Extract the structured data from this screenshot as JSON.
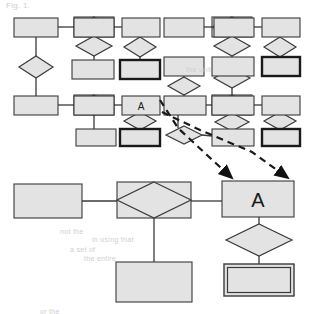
{
  "figure": {
    "kind": "er-diagram",
    "background_color": "#ffffff",
    "shape_fill": "#e3e3e3",
    "shape_stroke": "#3a3a3a",
    "bold_stroke": "#1a1a1a",
    "connector_color": "#3a3a3a",
    "callout_color": "#1a1a1a"
  },
  "overview": {
    "name": "overview-schema",
    "caption": "",
    "entities": [
      {
        "id": "ov-e1",
        "label": "",
        "x": 14,
        "y": 18,
        "w": 44,
        "h": 19,
        "style": "strong"
      },
      {
        "id": "ov-e2",
        "label": "",
        "x": 74,
        "y": 18,
        "w": 40,
        "h": 19,
        "style": "strong"
      },
      {
        "id": "ov-e3",
        "label": "",
        "x": 122,
        "y": 18,
        "w": 38,
        "h": 19,
        "style": "strong"
      },
      {
        "id": "ov-e4",
        "label": "",
        "x": 164,
        "y": 18,
        "w": 40,
        "h": 19,
        "style": "strong"
      },
      {
        "id": "ov-e5",
        "label": "",
        "x": 214,
        "y": 18,
        "w": 40,
        "h": 19,
        "style": "strong"
      },
      {
        "id": "ov-e6",
        "label": "",
        "x": 262,
        "y": 18,
        "w": 38,
        "h": 19,
        "style": "strong"
      },
      {
        "id": "ov-e7",
        "label": "",
        "x": 72,
        "y": 60,
        "w": 42,
        "h": 19,
        "style": "strong"
      },
      {
        "id": "ov-e8",
        "label": "",
        "x": 120,
        "y": 60,
        "w": 40,
        "h": 19,
        "style": "bold"
      },
      {
        "id": "ov-e9",
        "label": "",
        "x": 164,
        "y": 57,
        "w": 40,
        "h": 19,
        "style": "strong"
      },
      {
        "id": "ov-e10",
        "label": "",
        "x": 212,
        "y": 57,
        "w": 42,
        "h": 19,
        "style": "strong"
      },
      {
        "id": "ov-e11",
        "label": "",
        "x": 262,
        "y": 57,
        "w": 38,
        "h": 19,
        "style": "bold"
      },
      {
        "id": "ov-e12",
        "label": "",
        "x": 14,
        "y": 96,
        "w": 44,
        "h": 19,
        "style": "strong"
      },
      {
        "id": "ov-e13",
        "label": "",
        "x": 74,
        "y": 96,
        "w": 40,
        "h": 19,
        "style": "strong"
      },
      {
        "id": "ov-e14",
        "label": "A",
        "x": 122,
        "y": 96,
        "w": 38,
        "h": 19,
        "style": "strong"
      },
      {
        "id": "ov-e15",
        "label": "",
        "x": 164,
        "y": 96,
        "w": 42,
        "h": 19,
        "style": "strong"
      },
      {
        "id": "ov-e16",
        "label": "",
        "x": 212,
        "y": 96,
        "w": 42,
        "h": 19,
        "style": "strong"
      },
      {
        "id": "ov-e17",
        "label": "",
        "x": 262,
        "y": 96,
        "w": 38,
        "h": 19,
        "style": "strong"
      },
      {
        "id": "ov-e18",
        "label": "",
        "x": 76,
        "y": 129,
        "w": 40,
        "h": 17,
        "style": "strong"
      },
      {
        "id": "ov-e19",
        "label": "",
        "x": 120,
        "y": 129,
        "w": 40,
        "h": 17,
        "style": "bold"
      },
      {
        "id": "ov-e20",
        "label": "",
        "x": 212,
        "y": 129,
        "w": 42,
        "h": 17,
        "style": "strong"
      },
      {
        "id": "ov-e21",
        "label": "",
        "x": 262,
        "y": 129,
        "w": 38,
        "h": 17,
        "style": "bold"
      }
    ],
    "relationships": [
      {
        "id": "ov-r1",
        "label": "",
        "cx": 36,
        "cy": 67,
        "rx": 17,
        "ry": 11,
        "style": "plain"
      },
      {
        "id": "ov-r2",
        "label": "",
        "cx": 94,
        "cy": 27,
        "rx": 20,
        "ry": 10,
        "style": "boxed"
      },
      {
        "id": "ov-r3",
        "label": "",
        "cx": 94,
        "cy": 46,
        "rx": 18,
        "ry": 10,
        "style": "plain"
      },
      {
        "id": "ov-r4",
        "label": "",
        "cx": 140,
        "cy": 47,
        "rx": 16,
        "ry": 10,
        "style": "plain"
      },
      {
        "id": "ov-r5",
        "label": "",
        "cx": 232,
        "cy": 27,
        "rx": 20,
        "ry": 10,
        "style": "boxed"
      },
      {
        "id": "ov-r6",
        "label": "",
        "cx": 232,
        "cy": 46,
        "rx": 18,
        "ry": 10,
        "style": "plain"
      },
      {
        "id": "ov-r7",
        "label": "",
        "cx": 280,
        "cy": 47,
        "rx": 16,
        "ry": 10,
        "style": "plain"
      },
      {
        "id": "ov-r8",
        "label": "",
        "cx": 184,
        "cy": 86,
        "rx": 16,
        "ry": 9,
        "style": "plain"
      },
      {
        "id": "ov-r9",
        "label": "",
        "cx": 232,
        "cy": 78,
        "rx": 18,
        "ry": 10,
        "style": "plain"
      },
      {
        "id": "ov-r10",
        "label": "",
        "cx": 94,
        "cy": 105,
        "rx": 20,
        "ry": 10,
        "style": "boxed"
      },
      {
        "id": "ov-r11",
        "label": "",
        "cx": 232,
        "cy": 105,
        "rx": 20,
        "ry": 10,
        "style": "boxed"
      },
      {
        "id": "ov-r12",
        "label": "",
        "cx": 140,
        "cy": 121,
        "rx": 16,
        "ry": 9,
        "style": "plain"
      },
      {
        "id": "ov-r13",
        "label": "",
        "cx": 232,
        "cy": 122,
        "rx": 17,
        "ry": 9,
        "style": "plain"
      },
      {
        "id": "ov-r14",
        "label": "",
        "cx": 280,
        "cy": 121,
        "rx": 16,
        "ry": 9,
        "style": "plain"
      },
      {
        "id": "ov-r15",
        "label": "",
        "cx": 184,
        "cy": 135,
        "rx": 18,
        "ry": 9,
        "style": "plain"
      }
    ],
    "connectors": [
      {
        "from": "ov-e1",
        "to": "ov-r2",
        "x1": 58,
        "y1": 27,
        "x2": 74,
        "y2": 27
      },
      {
        "from": "ov-r2",
        "to": "ov-e3",
        "x1": 114,
        "y1": 27,
        "x2": 122,
        "y2": 27
      },
      {
        "from": "ov-e1",
        "to": "ov-r1",
        "x1": 36,
        "y1": 37,
        "x2": 36,
        "y2": 56
      },
      {
        "from": "ov-r1",
        "to": "ov-e12",
        "x1": 36,
        "y1": 78,
        "x2": 36,
        "y2": 96
      },
      {
        "from": "ov-r2",
        "to": "ov-r3",
        "x1": 94,
        "y1": 37,
        "x2": 94,
        "y2": 36
      },
      {
        "from": "ov-r3",
        "to": "ov-e7",
        "x1": 94,
        "y1": 56,
        "x2": 94,
        "y2": 60
      },
      {
        "from": "ov-e3",
        "to": "ov-r4",
        "x1": 140,
        "y1": 37,
        "x2": 140,
        "y2": 37
      },
      {
        "from": "ov-r4",
        "to": "ov-e8",
        "x1": 140,
        "y1": 57,
        "x2": 140,
        "y2": 60
      },
      {
        "from": "ov-e4",
        "to": "ov-r5",
        "x1": 204,
        "y1": 27,
        "x2": 212,
        "y2": 27
      },
      {
        "from": "ov-r5",
        "to": "ov-e6",
        "x1": 252,
        "y1": 27,
        "x2": 262,
        "y2": 27
      },
      {
        "from": "ov-r5",
        "to": "ov-r6",
        "x1": 232,
        "y1": 37,
        "x2": 232,
        "y2": 36
      },
      {
        "from": "ov-r6",
        "to": "ov-e10",
        "x1": 232,
        "y1": 56,
        "x2": 232,
        "y2": 57
      },
      {
        "from": "ov-e6",
        "to": "ov-r7",
        "x1": 280,
        "y1": 37,
        "x2": 280,
        "y2": 37
      },
      {
        "from": "ov-r7",
        "to": "ov-e11",
        "x1": 280,
        "y1": 57,
        "x2": 280,
        "y2": 57
      },
      {
        "from": "ov-e9",
        "to": "ov-r8",
        "x1": 184,
        "y1": 76,
        "x2": 184,
        "y2": 77
      },
      {
        "from": "ov-r8",
        "to": "ov-e15",
        "x1": 184,
        "y1": 95,
        "x2": 184,
        "y2": 96
      },
      {
        "from": "ov-e10",
        "to": "ov-r9",
        "x1": 232,
        "y1": 76,
        "x2": 232,
        "y2": 68
      },
      {
        "from": "ov-r9",
        "to": "ov-r11",
        "x1": 232,
        "y1": 88,
        "x2": 232,
        "y2": 95
      },
      {
        "from": "ov-e12",
        "to": "ov-r10",
        "x1": 58,
        "y1": 105,
        "x2": 74,
        "y2": 105
      },
      {
        "from": "ov-r10",
        "to": "ov-e14",
        "x1": 114,
        "y1": 105,
        "x2": 122,
        "y2": 105
      },
      {
        "from": "ov-r10",
        "to": "ov-e18",
        "x1": 94,
        "y1": 115,
        "x2": 94,
        "y2": 129
      },
      {
        "from": "ov-e14",
        "to": "ov-r12",
        "x1": 140,
        "y1": 115,
        "x2": 140,
        "y2": 112
      },
      {
        "from": "ov-r12",
        "to": "ov-e19",
        "x1": 140,
        "y1": 130,
        "x2": 140,
        "y2": 129
      },
      {
        "from": "ov-e15",
        "to": "ov-r11",
        "x1": 206,
        "y1": 105,
        "x2": 212,
        "y2": 105
      },
      {
        "from": "ov-r11",
        "to": "ov-e17",
        "x1": 252,
        "y1": 105,
        "x2": 262,
        "y2": 105
      },
      {
        "from": "ov-r11",
        "to": "ov-r13",
        "x1": 232,
        "y1": 115,
        "x2": 232,
        "y2": 113
      },
      {
        "from": "ov-r13",
        "to": "ov-e20",
        "x1": 232,
        "y1": 131,
        "x2": 232,
        "y2": 129
      },
      {
        "from": "ov-e17",
        "to": "ov-r14",
        "x1": 280,
        "y1": 115,
        "x2": 280,
        "y2": 112
      },
      {
        "from": "ov-r14",
        "to": "ov-e21",
        "x1": 280,
        "y1": 130,
        "x2": 280,
        "y2": 129
      },
      {
        "from": "ov-e15",
        "to": "ov-r15",
        "x1": 178,
        "y1": 115,
        "x2": 178,
        "y2": 128
      },
      {
        "from": "ov-r15",
        "to": "ov-e20",
        "x1": 202,
        "y1": 135,
        "x2": 212,
        "y2": 136
      }
    ]
  },
  "detail": {
    "name": "detail-magnified-view",
    "entities": [
      {
        "id": "dt-e1",
        "label": "",
        "x": 14,
        "y": 184,
        "w": 68,
        "h": 34,
        "style": "strong"
      },
      {
        "id": "dt-e2",
        "label": "A",
        "x": 222,
        "y": 181,
        "w": 72,
        "h": 36,
        "style": "strong"
      },
      {
        "id": "dt-e3",
        "label": "",
        "x": 116,
        "y": 262,
        "w": 76,
        "h": 40,
        "style": "strong"
      },
      {
        "id": "dt-e4",
        "label": "",
        "x": 224,
        "y": 264,
        "w": 70,
        "h": 32,
        "style": "weak"
      }
    ],
    "relationships": [
      {
        "id": "dt-r1",
        "label": "",
        "cx": 154,
        "cy": 200,
        "rx": 37,
        "ry": 18,
        "style": "boxed"
      },
      {
        "id": "dt-r2",
        "label": "",
        "cx": 259,
        "cy": 240,
        "rx": 33,
        "ry": 16,
        "style": "plain"
      }
    ],
    "connectors": [
      {
        "from": "dt-e1",
        "to": "dt-r1",
        "x1": 82,
        "y1": 201,
        "x2": 117,
        "y2": 201
      },
      {
        "from": "dt-r1",
        "to": "dt-e2",
        "x1": 191,
        "y1": 201,
        "x2": 222,
        "y2": 201
      },
      {
        "from": "dt-r1",
        "to": "dt-e3",
        "x1": 154,
        "y1": 218,
        "x2": 154,
        "y2": 262
      },
      {
        "from": "dt-e2",
        "to": "dt-r2",
        "x1": 259,
        "y1": 217,
        "x2": 259,
        "y2": 224
      },
      {
        "from": "dt-r2",
        "to": "dt-e4",
        "x1": 259,
        "y1": 256,
        "x2": 259,
        "y2": 264
      }
    ]
  },
  "callouts": [
    {
      "id": "callout-left",
      "name": "magnify-arrow-left",
      "style": "dashed-arrow",
      "from_entity": "ov-e14",
      "to_entity": "dt-e2",
      "points": "160,100 178,128 208,156 232,178"
    },
    {
      "id": "callout-right",
      "name": "magnify-arrow-right",
      "style": "dashed-arrow",
      "from_entity": "ov-e14",
      "to_entity": "dt-e2",
      "points": "162,112 200,130 252,152 288,178"
    }
  ],
  "ghost_text": [
    {
      "text": "Fig. 1.",
      "x": 6,
      "y": 1,
      "size": 8
    },
    {
      "text": "the unit",
      "x": 186,
      "y": 66,
      "size": 7
    },
    {
      "text": "not the",
      "x": 60,
      "y": 228,
      "size": 7
    },
    {
      "text": "in using that",
      "x": 92,
      "y": 236,
      "size": 7
    },
    {
      "text": "a set of",
      "x": 70,
      "y": 246,
      "size": 7
    },
    {
      "text": "the entire",
      "x": 84,
      "y": 255,
      "size": 7
    },
    {
      "text": "or the",
      "x": 40,
      "y": 308,
      "size": 7
    }
  ]
}
